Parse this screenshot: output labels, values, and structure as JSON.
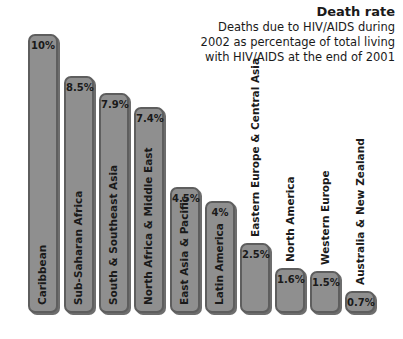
{
  "title": "Death rate",
  "subtitle": "Deaths due to HIV/AIDS during 2002 as percentage of total living with HIV/AIDS at the end of 2001",
  "colors": {
    "bar_fill": "#8f8f8f",
    "bar_border": "#5e5e5e",
    "text": "#1a1a1a"
  },
  "chart_data": {
    "type": "bar",
    "title": "Death rate",
    "subtitle": "Deaths due to HIV/AIDS during 2002 as percentage of total living with HIV/AIDS at the end of 2001",
    "xlabel": "",
    "ylabel": "",
    "ylim": [
      0,
      10
    ],
    "grid": false,
    "legend": "none",
    "categories": [
      "Caribbean",
      "Sub-Saharan Africa",
      "South & Southeast Asia",
      "North Africa & Middle East",
      "East Asia & Pacific",
      "Latin America",
      "Eastern Europe & Central Asia",
      "North America",
      "Western Europe",
      "Australia & New Zealand"
    ],
    "values": [
      10,
      8.5,
      7.9,
      7.4,
      4.5,
      4,
      2.5,
      1.6,
      1.5,
      0.7
    ],
    "value_labels": [
      "10%",
      "8.5%",
      "7.9%",
      "7.4%",
      "4.5%",
      "4%",
      "2.5%",
      "1.6%",
      "1.5%",
      "0.7%"
    ]
  },
  "bars": [
    {
      "label": "Caribbean",
      "value_label": "10%"
    },
    {
      "label": "Sub-Saharan Africa",
      "value_label": "8.5%"
    },
    {
      "label": "South & Southeast Asia",
      "value_label": "7.9%"
    },
    {
      "label": "North Africa & Middle East",
      "value_label": "7.4%"
    },
    {
      "label": "East Asia & Pacific",
      "value_label": "4.5%"
    },
    {
      "label": "Latin America",
      "value_label": "4%"
    },
    {
      "label": "Eastern Europe & Central Asia",
      "value_label": "2.5%"
    },
    {
      "label": "North America",
      "value_label": "1.6%"
    },
    {
      "label": "Western Europe",
      "value_label": "1.5%"
    },
    {
      "label": "Australia & New Zealand",
      "value_label": "0.7%"
    }
  ]
}
